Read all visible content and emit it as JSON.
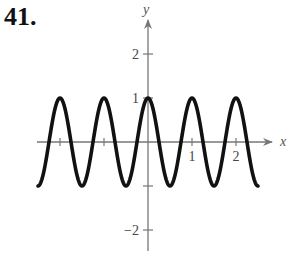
{
  "problem": {
    "number": "41."
  },
  "colors": {
    "axis": "#777777",
    "curve": "#111111",
    "text": "#444444"
  },
  "chart_data": {
    "type": "line",
    "title": "",
    "function": "y = cos(2πx)",
    "xlabel": "x",
    "ylabel": "y",
    "xlim": [
      -2.5,
      2.9
    ],
    "ylim": [
      -2.5,
      3.2
    ],
    "x_ticks": [
      -2,
      -1,
      1,
      2
    ],
    "x_tick_labels": [
      "",
      "",
      "1",
      "2"
    ],
    "y_ticks": [
      -2,
      -1,
      1,
      2
    ],
    "y_tick_labels": [
      "−2",
      "",
      "1",
      "2"
    ],
    "grid": false,
    "legend": null,
    "series": [
      {
        "name": "curve",
        "x": [
          -2.5,
          -2.25,
          -2.0,
          -1.75,
          -1.5,
          -1.25,
          -1.0,
          -0.75,
          -0.5,
          -0.25,
          0.0,
          0.25,
          0.5,
          0.75,
          1.0,
          1.25,
          1.5,
          1.75,
          2.0,
          2.25,
          2.5
        ],
        "values": [
          -1,
          0,
          1,
          0,
          -1,
          0,
          1,
          0,
          -1,
          0,
          1,
          0,
          -1,
          0,
          1,
          0,
          -1,
          0,
          1,
          0,
          -1
        ]
      }
    ],
    "curve_domain": [
      -2.5,
      2.5
    ],
    "amplitude": 1,
    "period": 1
  }
}
